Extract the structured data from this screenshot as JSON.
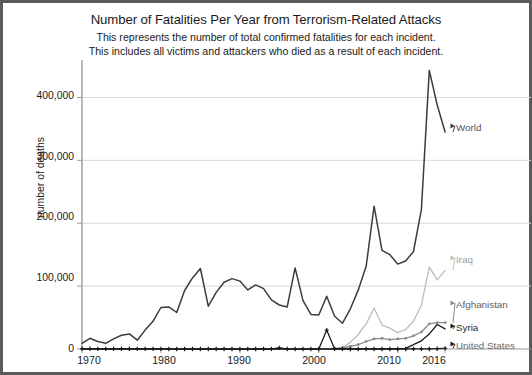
{
  "title": "Number of Fatalities Per Year from Terrorism-Related Attacks",
  "subtitle_line1": "This represents the number of total confirmed fatalities for each incident.",
  "subtitle_line2": "This includes all victims and attackers who died as a result of each incident.",
  "chart_data": {
    "type": "line",
    "title": "Number of Fatalities Per Year from Terrorism-Related Attacks",
    "subtitle": "This represents the number of total confirmed fatalities for each incident. This includes all victims and attackers who died as a result of each incident.",
    "xlabel": "",
    "ylabel": "number of deaths",
    "xlim": [
      1970,
      2017
    ],
    "ylim": [
      0,
      450000
    ],
    "grid": true,
    "grid_axis": "y",
    "legend_position": "right-inline-labels",
    "xticks": [
      1970,
      1980,
      1990,
      2000,
      2010,
      2016
    ],
    "xtick_labels": [
      "1970",
      "1980",
      "1990",
      "2000",
      "2010",
      "2016"
    ],
    "yticks": [
      0,
      100000,
      200000,
      300000,
      400000
    ],
    "ytick_labels": [
      "0",
      "100,000",
      "200,000",
      "300,000",
      "400,000"
    ],
    "x": [
      1970,
      1971,
      1972,
      1973,
      1974,
      1975,
      1976,
      1977,
      1978,
      1979,
      1980,
      1981,
      1982,
      1983,
      1984,
      1985,
      1986,
      1987,
      1988,
      1989,
      1990,
      1991,
      1992,
      1993,
      1994,
      1995,
      1996,
      1997,
      1998,
      1999,
      2000,
      2001,
      2002,
      2003,
      2004,
      2005,
      2006,
      2007,
      2008,
      2009,
      2010,
      2011,
      2012,
      2013,
      2014,
      2015,
      2016
    ],
    "series": [
      {
        "name": "World",
        "color": "#3c3c3c",
        "marker": "none",
        "values": [
          900,
          1700,
          1200,
          900,
          1600,
          2200,
          2400,
          1400,
          3000,
          4400,
          6600,
          6700,
          5800,
          9300,
          11300,
          12800,
          6800,
          9000,
          10600,
          11200,
          10800,
          9400,
          10200,
          9600,
          7800,
          7000,
          6700,
          12900,
          7700,
          5500,
          5400,
          8400,
          5200,
          4100,
          6400,
          9400,
          13200,
          22700,
          15700,
          15000,
          13500,
          14000,
          15500,
          22200,
          44300,
          38800,
          34500
        ],
        "label": "World"
      },
      {
        "name": "Iraq",
        "color": "#bcbcbc",
        "marker": "none",
        "values": [
          0,
          0,
          0,
          0,
          0,
          0,
          0,
          0,
          0,
          0,
          0,
          0,
          0,
          0,
          0,
          0,
          0,
          0,
          0,
          0,
          0,
          0,
          0,
          0,
          0,
          0,
          0,
          0,
          0,
          0,
          0,
          0,
          0,
          200,
          1100,
          2300,
          4000,
          6500,
          3800,
          3300,
          2600,
          3100,
          4400,
          7000,
          13000,
          11000,
          12500
        ],
        "label": "Iraq"
      },
      {
        "name": "Afghanistan",
        "color": "#8a8a8a",
        "marker": "dot",
        "values": [
          0,
          0,
          0,
          0,
          0,
          0,
          0,
          0,
          0,
          0,
          0,
          0,
          0,
          0,
          0,
          0,
          0,
          0,
          0,
          0,
          0,
          0,
          0,
          0,
          0,
          0,
          0,
          0,
          0,
          0,
          0,
          0,
          100,
          200,
          400,
          700,
          1200,
          1600,
          1700,
          1500,
          1600,
          1700,
          2100,
          2700,
          4000,
          4200,
          4200
        ],
        "label": "Afghanistan"
      },
      {
        "name": "Syria",
        "color": "#1a1a1a",
        "marker": "none",
        "values": [
          0,
          0,
          0,
          0,
          0,
          0,
          0,
          0,
          0,
          0,
          0,
          0,
          0,
          0,
          0,
          0,
          0,
          0,
          0,
          0,
          0,
          0,
          0,
          0,
          0,
          0,
          0,
          0,
          0,
          0,
          0,
          0,
          0,
          0,
          0,
          0,
          0,
          0,
          0,
          0,
          0,
          100,
          700,
          1300,
          2400,
          3900,
          3200
        ],
        "label": "Syria"
      },
      {
        "name": "United States",
        "color": "#1a1a1a",
        "marker": "plus",
        "values": [
          40,
          30,
          20,
          20,
          30,
          40,
          30,
          20,
          20,
          20,
          20,
          10,
          10,
          10,
          10,
          10,
          10,
          10,
          10,
          10,
          10,
          10,
          10,
          20,
          10,
          180,
          10,
          10,
          10,
          10,
          10,
          3000,
          10,
          10,
          10,
          10,
          10,
          10,
          10,
          10,
          10,
          10,
          10,
          10,
          10,
          50,
          100
        ],
        "label": "United States"
      }
    ],
    "series_value_scale_note": "values plotted on axis with maximum 450,000",
    "annotations": [
      {
        "text": "World",
        "x": 2016,
        "y": 345000
      },
      {
        "text": "Iraq",
        "x": 2016,
        "y": 125000
      },
      {
        "text": "Afghanistan",
        "x": 2016,
        "y": 42000
      },
      {
        "text": "Syria",
        "x": 2016,
        "y": 22000
      },
      {
        "text": "United States",
        "x": 2016,
        "y": 3000
      }
    ]
  }
}
